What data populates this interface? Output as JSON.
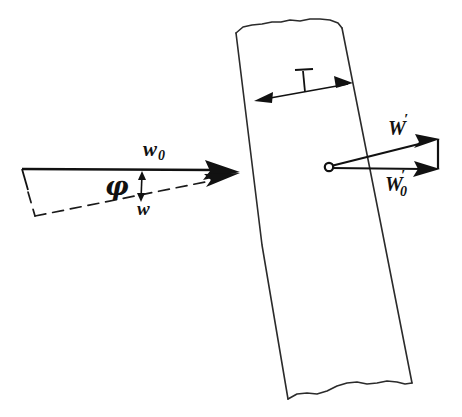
{
  "figure": {
    "background_color": "#ffffff",
    "ink_color": "#111111",
    "width": 462,
    "height": 417
  },
  "labels": {
    "w_zero": {
      "base": "w",
      "subscript": "0",
      "description": "upstream relative velocity vector label"
    },
    "w_mean": {
      "base": "w",
      "subscript": "",
      "description": "mean relative velocity vector label"
    },
    "phi": {
      "symbol": "φ",
      "description": "flow angle between w0 and w"
    },
    "thickness": {
      "symbol": "t",
      "description": "band thickness dimension"
    },
    "w_prime": {
      "base": "W",
      "prime": "′",
      "subscript": "",
      "description": "upper resultant vector label"
    },
    "w_prime_zero": {
      "base": "W",
      "prime": "′",
      "subscript": "0",
      "description": "lower resultant vector label"
    }
  },
  "elements": {
    "band": {
      "name": "inclined-band",
      "top_edge_style": "torn",
      "bottom_edge_style": "torn",
      "fill": "none"
    },
    "left_vector_group": {
      "solid_arrow": "w0 horizontal vector",
      "dashed_arrow": "w inclined vector",
      "angle_marker": "vertical double arrow for phi"
    },
    "right_vector_group": {
      "origin": "open circle",
      "upper_arrow": "W prime",
      "lower_arrow": "W prime zero",
      "closing_edge": "vertical connector"
    },
    "dimension": {
      "name": "thickness-dimension-arrow",
      "style": "double-headed"
    }
  }
}
